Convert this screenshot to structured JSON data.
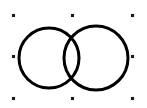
{
  "canvas": {
    "width": 147,
    "height": 108,
    "background_color": "#ffffff"
  },
  "shape": {
    "name": "two-overlapping-circles",
    "description": "Two overlapping outlined circles forming a lens-shaped intersection",
    "stroke_color": "#000000",
    "fill_color": "none",
    "stroke_width": 3,
    "circles": [
      {
        "label": "left-circle",
        "cx": 49,
        "cy": 58,
        "r": 30
      },
      {
        "label": "right-circle",
        "cx": 96,
        "cy": 58,
        "r": 32
      }
    ]
  },
  "selection": {
    "active": true,
    "handle_color": "#1a1a1a",
    "handle_border_color": "#f2f2f2",
    "handle_size": 5,
    "bounds": {
      "x": 14,
      "y": 16,
      "width": 119,
      "height": 83
    },
    "handles": [
      {
        "label": "handle-top-left",
        "position": "top-left",
        "x": 14,
        "y": 16
      },
      {
        "label": "handle-top-center",
        "position": "top-center",
        "x": 73,
        "y": 16
      },
      {
        "label": "handle-top-right",
        "position": "top-right",
        "x": 133,
        "y": 16
      },
      {
        "label": "handle-middle-left",
        "position": "middle-left",
        "x": 14,
        "y": 57
      },
      {
        "label": "handle-middle-right",
        "position": "middle-right",
        "x": 133,
        "y": 57
      },
      {
        "label": "handle-bottom-left",
        "position": "bottom-left",
        "x": 14,
        "y": 99
      },
      {
        "label": "handle-bottom-center",
        "position": "bottom-center",
        "x": 73,
        "y": 99
      },
      {
        "label": "handle-bottom-right",
        "position": "bottom-right",
        "x": 133,
        "y": 99
      }
    ]
  }
}
